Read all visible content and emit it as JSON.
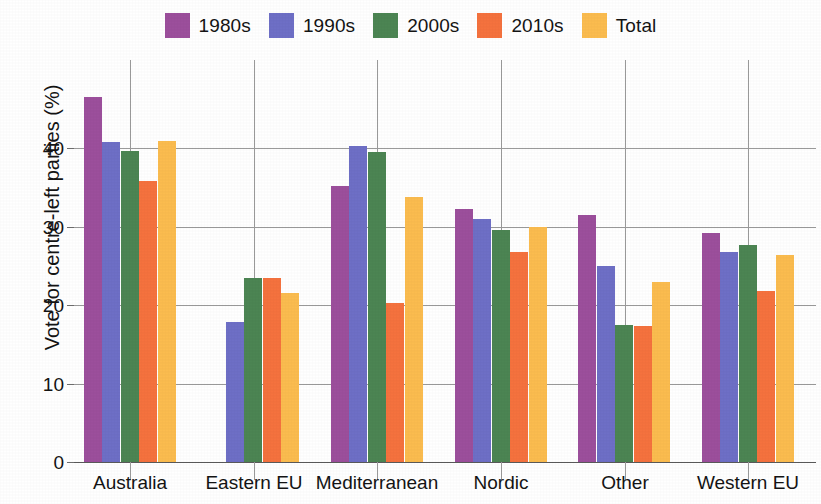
{
  "chart_data": {
    "type": "bar",
    "title": "",
    "subtitle": "",
    "xlabel": "",
    "ylabel": "Vote for centre-left parties (%)",
    "categories": [
      "Australia",
      "Eastern EU",
      "Mediterranean",
      "Nordic",
      "Other",
      "Western EU"
    ],
    "series": [
      {
        "name": "1980s",
        "color": "#9C4F9C",
        "values": [
          46.5,
          null,
          35.1,
          32.2,
          31.5,
          29.2
        ]
      },
      {
        "name": "1990s",
        "color": "#6E6FC6",
        "values": [
          40.8,
          17.8,
          40.2,
          31.0,
          25.0,
          26.8
        ]
      },
      {
        "name": "2000s",
        "color": "#4C8553",
        "values": [
          39.6,
          23.5,
          39.5,
          29.6,
          17.5,
          27.6
        ]
      },
      {
        "name": "2010s",
        "color": "#F5723E",
        "values": [
          35.8,
          23.4,
          20.3,
          26.7,
          17.3,
          21.8
        ]
      },
      {
        "name": "Total",
        "color": "#FBBC4F",
        "values": [
          40.9,
          21.5,
          33.7,
          30.0,
          22.9,
          26.4
        ]
      }
    ],
    "ylim": [
      0,
      48
    ],
    "yticks": [
      0,
      10,
      20,
      30,
      40
    ],
    "ytick_labels": [
      "0",
      "10",
      "20",
      "30",
      "40"
    ],
    "grid": "horizontal",
    "legend_position": "top-center",
    "legend_entries": [
      "1980s",
      "1990s",
      "2000s",
      "2010s",
      "Total"
    ],
    "axis_colors": {
      "gridline": "#9a9a9a",
      "baseline": "#5a5a5a",
      "text": "#141414",
      "background": "#ffffff"
    }
  }
}
